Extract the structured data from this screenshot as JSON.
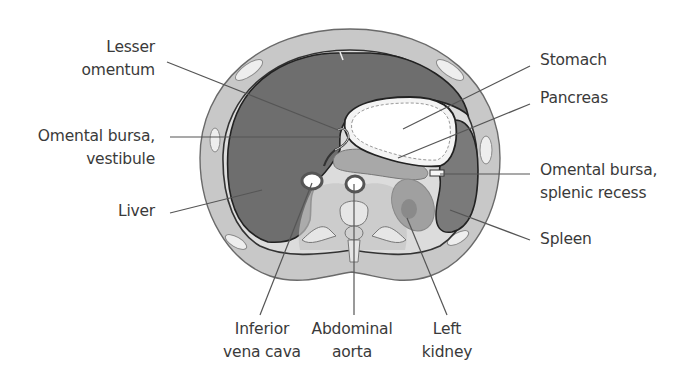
{
  "figure": {
    "type": "anatomical cross-section",
    "colors": {
      "body_wall": "#c8c8c8",
      "body_outline": "#6a6a6a",
      "liver": "#6e6e6e",
      "spleen": "#7a7a7a",
      "retroperitoneum": "#dcdcdc",
      "pancreas": "#a8a8a8",
      "kidney": "#a0a0a0",
      "stomach_lumen": "#ffffff",
      "leader_line": "#555555",
      "label_text": "#3a3a3a"
    }
  },
  "labels": {
    "lesser_omentum": {
      "line1": "Lesser",
      "line2": "omentum"
    },
    "omental_bursa_vestibule": {
      "line1": "Omental bursa,",
      "line2": "vestibule"
    },
    "liver": {
      "line1": "Liver"
    },
    "stomach": {
      "line1": "Stomach"
    },
    "pancreas": {
      "line1": "Pancreas"
    },
    "omental_bursa_splenic_recess": {
      "line1": "Omental bursa,",
      "line2": "splenic recess"
    },
    "spleen": {
      "line1": "Spleen"
    },
    "inferior_vena_cava": {
      "line1": "Inferior",
      "line2": "vena cava"
    },
    "abdominal_aorta": {
      "line1": "Abdominal",
      "line2": "aorta"
    },
    "left_kidney": {
      "line1": "Left",
      "line2": "kidney"
    }
  }
}
